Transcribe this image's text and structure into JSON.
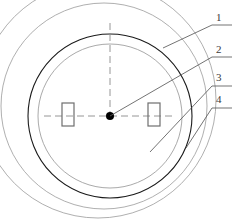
{
  "figure": {
    "kind": "engineering-cross-section",
    "background_color": "#ffffff",
    "line_color_primary": "#1a1a1a",
    "line_color_secondary": "#6e6e6e",
    "line_color_light": "#9a9a9a",
    "centerline_color": "#8a8a8a",
    "leader_color": "#5a5a5a",
    "label_color": "#3a3a3a"
  },
  "geometry": {
    "center_point": {
      "x": 110,
      "y": 116,
      "radius": 4,
      "fill": "#000000"
    },
    "circles": [
      {
        "name": "inner-bore-circle",
        "cx": 110,
        "cy": 116,
        "r": 82,
        "stroke": "#1a1a1a",
        "stroke_width": 1.1
      },
      {
        "name": "second-circle",
        "cx": 110,
        "cy": 116,
        "r": 72,
        "stroke": "#8f8f8f",
        "stroke_width": 0.8
      },
      {
        "name": "third-circle",
        "cx": 104,
        "cy": 106,
        "r": 103,
        "stroke": "#8f8f8f",
        "stroke_width": 0.8
      },
      {
        "name": "outer-circle",
        "cx": 98,
        "cy": 100,
        "r": 118,
        "stroke": "#8f8f8f",
        "stroke_width": 0.8
      }
    ],
    "rectangles": [
      {
        "name": "left-key-rectangle",
        "x": 62,
        "y": 103,
        "width": 12,
        "height": 23,
        "stroke": "#6e6e6e",
        "stroke_width": 1.2
      },
      {
        "name": "right-key-rectangle",
        "x": 148,
        "y": 103,
        "width": 12,
        "height": 23,
        "stroke": "#6e6e6e",
        "stroke_width": 1.2
      }
    ],
    "centerlines": [
      {
        "name": "vertical-centerline",
        "x1": 110,
        "y1": 23,
        "x2": 110,
        "y2": 116
      },
      {
        "name": "horizontal-centerline",
        "x1": 44,
        "y1": 116,
        "x2": 176,
        "y2": 116
      }
    ]
  },
  "callouts": [
    {
      "id": "1",
      "label": "1",
      "label_x": 216,
      "label_y": 12,
      "leader": {
        "x1": 163,
        "y1": 48,
        "x2": 212,
        "y2": 25,
        "x3": 232,
        "y3": 25
      },
      "anchor_on": "inner-bore-circle"
    },
    {
      "id": "2",
      "label": "2",
      "label_x": 216,
      "label_y": 44,
      "leader": {
        "x1": 110,
        "y1": 116,
        "x2": 212,
        "y2": 57,
        "x3": 232,
        "y3": 57
      },
      "anchor_on": "center-point"
    },
    {
      "id": "3",
      "label": "3",
      "label_x": 216,
      "label_y": 72,
      "leader": {
        "x1": 150,
        "y1": 152,
        "x2": 212,
        "y2": 86,
        "x3": 232,
        "y3": 86
      },
      "anchor_on": "third-circle"
    },
    {
      "id": "4",
      "label": "4",
      "label_x": 216,
      "label_y": 94,
      "leader": {
        "x1": 186,
        "y1": 148,
        "x2": 212,
        "y2": 108,
        "x3": 232,
        "y3": 108
      },
      "anchor_on": "outer-circle"
    }
  ]
}
